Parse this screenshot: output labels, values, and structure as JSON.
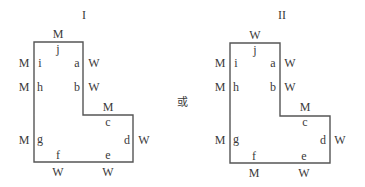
{
  "figures": [
    {
      "title": "I",
      "outer_labels": {
        "top": "M",
        "left_i": "M",
        "left_h": "M",
        "left_g": "M",
        "right_a": "W",
        "right_b": "W",
        "step_c": "M",
        "right_d": "W",
        "bottom_f": "W",
        "bottom_e": "W"
      },
      "inner_labels": {
        "a": "a",
        "b": "b",
        "c": "c",
        "d": "d",
        "e": "e",
        "f": "f",
        "g": "g",
        "h": "h",
        "i": "i",
        "j": "j"
      }
    },
    {
      "title": "II",
      "outer_labels": {
        "top": "W",
        "left_i": "M",
        "left_h": "M",
        "left_g": "M",
        "right_a": "W",
        "right_b": "W",
        "step_c": "M",
        "right_d": "W",
        "bottom_f": "M",
        "bottom_e": "W"
      },
      "inner_labels": {
        "a": "a",
        "b": "b",
        "c": "c",
        "d": "d",
        "e": "e",
        "f": "f",
        "g": "g",
        "h": "h",
        "i": "i",
        "j": "j"
      }
    }
  ],
  "conjunction": "或",
  "colors": {
    "line": "#555555",
    "text": "#3a3a3a"
  }
}
